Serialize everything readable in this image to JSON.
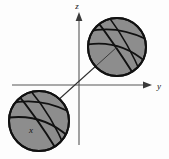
{
  "figure": {
    "title": "",
    "caption": "",
    "background_color": "#fdfdfd",
    "axes": {
      "z": {
        "label": "z",
        "direction": "up",
        "arrow": true,
        "label_x": 77,
        "label_y": 9
      },
      "y": {
        "label": "y",
        "direction": "right",
        "arrow": true,
        "label_x": 159,
        "label_y": 88
      },
      "x": {
        "label": "x",
        "direction": "down-left-diagonal",
        "arrow": true,
        "label_x": 31,
        "label_y": 130
      },
      "origin": {
        "x": 79,
        "y": 85
      },
      "axis_color": "#4a4a4a"
    },
    "spheres": [
      {
        "name": "upper-sphere",
        "cx": 117,
        "cy": 47,
        "r": 29,
        "fill_color": "#8d8d8d",
        "outline_color": "#111111"
      },
      {
        "name": "lower-sphere",
        "cx": 39,
        "cy": 121,
        "r": 30,
        "fill_color": "#8d8d8d",
        "outline_color": "#111111"
      }
    ],
    "diagonal_line": {
      "from_x": 117,
      "from_y": 47,
      "to_x": 32,
      "to_y": 124,
      "color": "#2a2a2a"
    }
  }
}
